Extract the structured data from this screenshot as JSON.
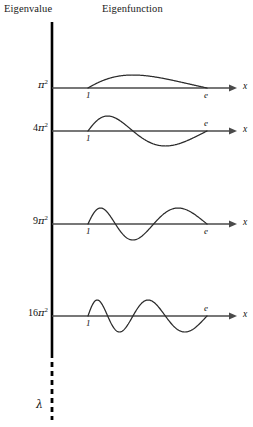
{
  "figure": {
    "background_color": "#ffffff",
    "ink_color": "#000000",
    "curve_color": "#2b2b2b",
    "axis_color": "#4a4a4a",
    "headers": {
      "eigenvalue": "Eigenvalue",
      "eigenfunction": "Eigenfunction"
    },
    "vertical_axis": {
      "name": "lambda-axis",
      "label": "λ",
      "solid_top_y": 22,
      "solid_bottom_y": 358,
      "dashed_top_y": 362,
      "dashed_bottom_y": 420,
      "x": 52
    },
    "rows": [
      {
        "eigenvalue_label": "π",
        "eigenvalue_coefficient": "",
        "eigenvalue_exponent": "2",
        "eigenvalue_value": "π²",
        "mode": 1,
        "axis_y": 88,
        "x_axis_label": "x",
        "tick_left": "1",
        "tick_right": "e",
        "tick_right_above_axis": false,
        "amplitude": 13
      },
      {
        "eigenvalue_label": "π",
        "eigenvalue_coefficient": "4",
        "eigenvalue_exponent": "2",
        "eigenvalue_value": "4π²",
        "mode": 2,
        "axis_y": 131,
        "x_axis_label": "x",
        "tick_left": "1",
        "tick_right": "e",
        "tick_right_above_axis": true,
        "amplitude": 15
      },
      {
        "eigenvalue_label": "π",
        "eigenvalue_coefficient": "9",
        "eigenvalue_exponent": "2",
        "eigenvalue_value": "9π²",
        "mode": 3,
        "axis_y": 224,
        "x_axis_label": "x",
        "tick_left": "1",
        "tick_right": "e",
        "tick_right_above_axis": false,
        "amplitude": 16
      },
      {
        "eigenvalue_label": "π",
        "eigenvalue_coefficient": "16",
        "eigenvalue_exponent": "2",
        "eigenvalue_value": "16π²",
        "mode": 4,
        "axis_y": 316,
        "x_axis_label": "x",
        "tick_left": "1",
        "tick_right": "e",
        "tick_right_above_axis": true,
        "amplitude": 16
      }
    ],
    "geometry": {
      "curve_x_start": 88,
      "curve_x_end": 207,
      "axis_x_start": 52,
      "axis_arrow_tip": 237,
      "x_label_x": 243
    }
  },
  "chart_data": {
    "type": "line",
    "title": "",
    "xlabel": "x",
    "ylabel": "",
    "series": [
      {
        "name": "n=1",
        "eigenvalue": "π²",
        "formula": "sin(1·π·ln x)",
        "half_periods": 1
      },
      {
        "name": "n=2",
        "eigenvalue": "4π²",
        "formula": "sin(2·π·ln x)",
        "half_periods": 2
      },
      {
        "name": "n=3",
        "eigenvalue": "9π²",
        "formula": "sin(3·π·ln x)",
        "half_periods": 3
      },
      {
        "name": "n=4",
        "eigenvalue": "16π²",
        "formula": "sin(4·π·ln x)",
        "half_periods": 4
      }
    ],
    "x": [
      1,
      2.718281828
    ],
    "xlim": [
      1,
      2.718281828
    ],
    "xticks": [
      "1",
      "e"
    ],
    "grid": false,
    "legend": "none"
  }
}
